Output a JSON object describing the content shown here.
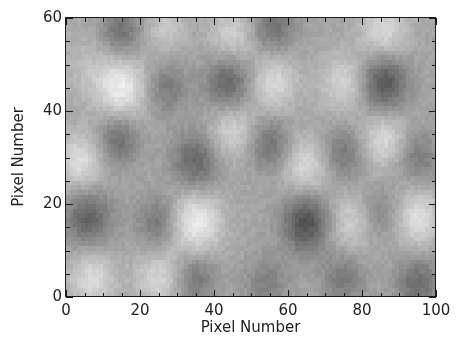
{
  "chart_data": {
    "type": "heatmap",
    "title": "",
    "xlabel": "Pixel Number",
    "ylabel": "Pixel Number",
    "xlim": [
      0,
      100
    ],
    "ylim": [
      0,
      60
    ],
    "grid_size": {
      "nx": 100,
      "ny": 60
    },
    "colormap": "grayscale",
    "gray_range": {
      "min": "#303030",
      "max": "#f0f0f0",
      "mid": "#a0a0a0"
    },
    "grid": false,
    "legend": "none",
    "x_major_ticks": [
      0,
      20,
      40,
      60,
      80,
      100
    ],
    "x_minor_step": 5,
    "y_major_ticks": [
      0,
      20,
      40,
      60
    ],
    "y_minor_step": 5,
    "blobs": [
      {
        "x": 15,
        "y": 57,
        "amp": -0.55,
        "sigma": 4.0
      },
      {
        "x": 44,
        "y": 46,
        "amp": -0.7,
        "sigma": 4.5
      },
      {
        "x": 86,
        "y": 46,
        "amp": -0.85,
        "sigma": 4.5
      },
      {
        "x": 27,
        "y": 45,
        "amp": -0.45,
        "sigma": 4.0
      },
      {
        "x": 56,
        "y": 58,
        "amp": -0.55,
        "sigma": 4.0
      },
      {
        "x": 14,
        "y": 34,
        "amp": -0.6,
        "sigma": 4.0
      },
      {
        "x": 35,
        "y": 29,
        "amp": -0.65,
        "sigma": 4.5
      },
      {
        "x": 55,
        "y": 33,
        "amp": -0.55,
        "sigma": 4.0
      },
      {
        "x": 75,
        "y": 31,
        "amp": -0.5,
        "sigma": 4.0
      },
      {
        "x": 95,
        "y": 30,
        "amp": -0.45,
        "sigma": 4.0
      },
      {
        "x": 6,
        "y": 17,
        "amp": -0.7,
        "sigma": 4.5
      },
      {
        "x": 25,
        "y": 16,
        "amp": -0.5,
        "sigma": 4.0
      },
      {
        "x": 65,
        "y": 16,
        "amp": -0.9,
        "sigma": 4.5
      },
      {
        "x": 85,
        "y": 18,
        "amp": -0.35,
        "sigma": 4.0
      },
      {
        "x": 35,
        "y": 4,
        "amp": -0.5,
        "sigma": 4.0
      },
      {
        "x": 54,
        "y": 3,
        "amp": -0.4,
        "sigma": 4.0
      },
      {
        "x": 75,
        "y": 4,
        "amp": -0.45,
        "sigma": 4.0
      },
      {
        "x": 95,
        "y": 3,
        "amp": -0.6,
        "sigma": 4.0
      },
      {
        "x": 15,
        "y": 45,
        "amp": 0.75,
        "sigma": 5.0
      },
      {
        "x": 56,
        "y": 46,
        "amp": 0.55,
        "sigma": 4.5
      },
      {
        "x": 75,
        "y": 46,
        "amp": 0.5,
        "sigma": 4.5
      },
      {
        "x": 86,
        "y": 57,
        "amp": 0.55,
        "sigma": 4.5
      },
      {
        "x": 4,
        "y": 29,
        "amp": 0.6,
        "sigma": 4.5
      },
      {
        "x": 45,
        "y": 36,
        "amp": 0.5,
        "sigma": 4.5
      },
      {
        "x": 65,
        "y": 28,
        "amp": 0.55,
        "sigma": 4.5
      },
      {
        "x": 86,
        "y": 34,
        "amp": 0.55,
        "sigma": 4.5
      },
      {
        "x": 35,
        "y": 16,
        "amp": 0.75,
        "sigma": 5.0
      },
      {
        "x": 95,
        "y": 17,
        "amp": 0.6,
        "sigma": 4.5
      },
      {
        "x": 7,
        "y": 4,
        "amp": 0.55,
        "sigma": 4.5
      },
      {
        "x": 25,
        "y": 4,
        "amp": 0.5,
        "sigma": 4.5
      },
      {
        "x": 45,
        "y": 56,
        "amp": 0.45,
        "sigma": 4.5
      },
      {
        "x": 77,
        "y": 16,
        "amp": 0.45,
        "sigma": 4.5
      },
      {
        "x": 27,
        "y": 58,
        "amp": 0.35,
        "sigma": 4.0
      },
      {
        "x": 5,
        "y": 50,
        "amp": 0.2,
        "sigma": 5.0
      }
    ]
  },
  "axes": {
    "x_tick_labels": [
      "0",
      "20",
      "40",
      "60",
      "80",
      "100"
    ],
    "y_tick_labels": [
      "0",
      "20",
      "40",
      "60"
    ]
  }
}
